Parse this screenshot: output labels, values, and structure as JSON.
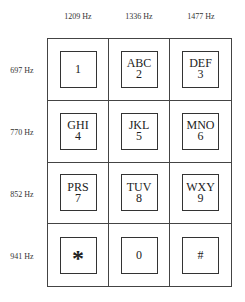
{
  "columns": [
    {
      "label": "1209 Hz"
    },
    {
      "label": "1336 Hz"
    },
    {
      "label": "1477 Hz"
    }
  ],
  "rows": [
    {
      "label": "697 Hz"
    },
    {
      "label": "770 Hz"
    },
    {
      "label": "852 Hz"
    },
    {
      "label": "941 Hz"
    }
  ],
  "keys": [
    {
      "letters": "",
      "digit": "1"
    },
    {
      "letters": "ABC",
      "digit": "2"
    },
    {
      "letters": "DEF",
      "digit": "3"
    },
    {
      "letters": "GHI",
      "digit": "4"
    },
    {
      "letters": "JKL",
      "digit": "5"
    },
    {
      "letters": "MNO",
      "digit": "6"
    },
    {
      "letters": "PRS",
      "digit": "7"
    },
    {
      "letters": "TUV",
      "digit": "8"
    },
    {
      "letters": "WXY",
      "digit": "9"
    },
    {
      "letters": "",
      "digit": "*"
    },
    {
      "letters": "",
      "digit": "0"
    },
    {
      "letters": "",
      "digit": "#"
    }
  ]
}
